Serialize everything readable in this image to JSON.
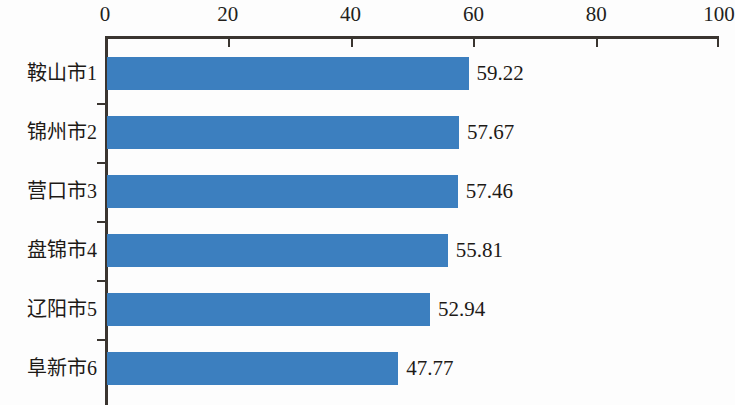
{
  "chart_data": {
    "type": "bar",
    "orientation": "horizontal",
    "title": "",
    "subtitle": "",
    "xlabel": "",
    "ylabel": "",
    "categories": [
      "鞍山市1",
      "锦州市2",
      "营口市3",
      "盘锦市4",
      "辽阳市5",
      "阜新市6"
    ],
    "values": [
      59.22,
      57.67,
      57.46,
      55.81,
      52.94,
      47.77
    ],
    "value_labels": [
      "59.22",
      "57.67",
      "57.46",
      "55.81",
      "52.94",
      "47.77"
    ],
    "xlim": [
      0,
      100
    ],
    "x_ticks": [
      0,
      20,
      40,
      60,
      80,
      100
    ],
    "x_tick_labels": [
      "0",
      "20",
      "40",
      "60",
      "80",
      "100"
    ],
    "grid": false,
    "legend": false,
    "axis_position": "top",
    "bar_color": "#3c7fbf",
    "axis_color": "#3a3530",
    "text_color": "#1d1a17",
    "background_color": "#fdfdfd"
  }
}
